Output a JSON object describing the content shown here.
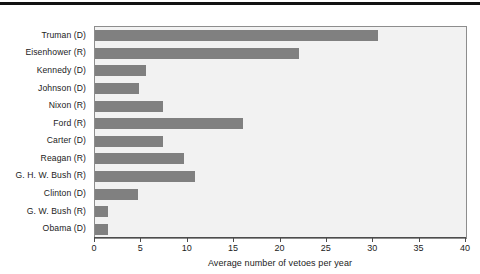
{
  "figure": {
    "top_rule": "horizontal-rule"
  },
  "chart_data": {
    "type": "bar",
    "orientation": "horizontal",
    "title": "",
    "subtitle": "",
    "xlabel": "Average number of vetoes per year",
    "ylabel": "",
    "xlim": [
      0,
      40
    ],
    "xticks": [
      0,
      5,
      10,
      15,
      20,
      25,
      30,
      35,
      40
    ],
    "xtick_labels": [
      "0",
      "5",
      "10",
      "15",
      "20",
      "25",
      "30",
      "35",
      "40"
    ],
    "grid": false,
    "legend": "none",
    "bar_color": "#808080",
    "plot_background": "#f2f2f2",
    "categories": [
      "Truman (D)",
      "Eisenhower (R)",
      "Kennedy (D)",
      "Johnson (D)",
      "Nixon (R)",
      "Ford (R)",
      "Carter (D)",
      "Reagan (R)",
      "G. H. W. Bush (R)",
      "Clinton (D)",
      "G. W. Bush (R)",
      "Obama (D)"
    ],
    "values": [
      30.5,
      22.0,
      5.5,
      4.7,
      7.3,
      16.0,
      7.3,
      9.6,
      10.8,
      4.6,
      1.4,
      1.4
    ]
  }
}
